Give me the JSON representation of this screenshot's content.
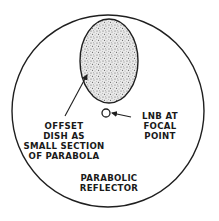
{
  "diagram": {
    "colors": {
      "stroke": "#1f1f1f",
      "background": "#ffffff",
      "stipple": "#6a6a6a",
      "text": "#1a1a1a"
    },
    "outer_circle": {
      "label_lines": [
        "PARABOLIC",
        "REFLECTOR"
      ]
    },
    "offset_dish": {
      "label_lines": [
        "OFFSET",
        "DISH AS",
        "SMALL SECTION",
        "OF PARABOLA"
      ]
    },
    "lnb": {
      "label_lines": [
        "LNB AT",
        "FOCAL",
        "POINT"
      ]
    }
  }
}
